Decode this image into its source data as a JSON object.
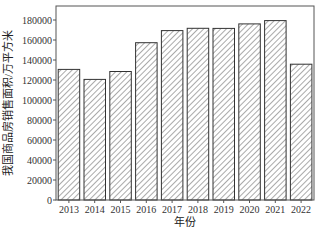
{
  "chart_data": {
    "type": "bar",
    "title": "",
    "xlabel": "年份",
    "ylabel": "我国商品房销售面积/万平方米",
    "categories": [
      "2013",
      "2014",
      "2015",
      "2016",
      "2017",
      "2018",
      "2019",
      "2020",
      "2021",
      "2022"
    ],
    "values": [
      130551,
      120649,
      128495,
      157349,
      169408,
      171654,
      171558,
      176086,
      179433,
      135837
    ],
    "ylim": [
      0,
      190000
    ],
    "yticks": [
      0,
      20000,
      40000,
      60000,
      80000,
      100000,
      120000,
      140000,
      160000,
      180000
    ],
    "grid": false,
    "legend": null,
    "bar_style": {
      "fill": "hatched diagonal",
      "edge_color": "#333333",
      "hatch_color": "#555555"
    }
  }
}
